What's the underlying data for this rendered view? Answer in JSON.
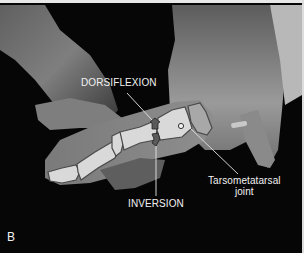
{
  "figure": {
    "panel_letter": "B",
    "colors": {
      "background": "#050505",
      "bone_fill": "#d9d9d9",
      "bone_outline": "#4a4a4a",
      "skin_light": "#9a9a9a",
      "skin_dark": "#3a3a3a",
      "label_text": "#f2f2f2",
      "arrow_fill": "#5a5a5a"
    }
  },
  "annotations": {
    "dorsiflexion": "DORSIFLEXION",
    "inversion": "INVERSION",
    "tmt_line1": "Tarsometatarsal",
    "tmt_line2": "joint"
  }
}
